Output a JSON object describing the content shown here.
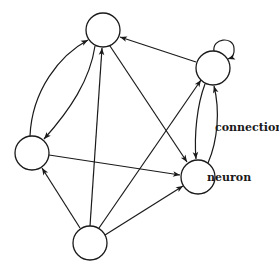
{
  "diagram": {
    "title": "",
    "labels": {
      "connection": "connection",
      "neuron": "neuron"
    },
    "colors": {
      "stroke": "#1a1a1a",
      "node_fill": "#ffffff",
      "background": "#ffffff"
    },
    "nodes": [
      {
        "id": "top",
        "cx": 103,
        "cy": 30,
        "r": 17
      },
      {
        "id": "right",
        "cx": 213,
        "cy": 68,
        "r": 17
      },
      {
        "id": "left",
        "cx": 32,
        "cy": 153,
        "r": 17
      },
      {
        "id": "neuron",
        "cx": 198,
        "cy": 177,
        "r": 17
      },
      {
        "id": "bottom",
        "cx": 90,
        "cy": 243,
        "r": 17
      }
    ],
    "edges": [
      {
        "from": "left",
        "to": "top",
        "shape": "curve"
      },
      {
        "from": "top",
        "to": "left",
        "shape": "curve"
      },
      {
        "from": "bottom",
        "to": "top",
        "shape": "straight"
      },
      {
        "from": "top",
        "to": "neuron",
        "shape": "straight"
      },
      {
        "from": "right",
        "to": "top",
        "shape": "straight"
      },
      {
        "from": "right",
        "to": "right",
        "shape": "self-loop"
      },
      {
        "from": "right",
        "to": "neuron",
        "shape": "curve"
      },
      {
        "from": "neuron",
        "to": "right",
        "shape": "curve"
      },
      {
        "from": "left",
        "to": "neuron",
        "shape": "straight"
      },
      {
        "from": "bottom",
        "to": "left",
        "shape": "straight"
      },
      {
        "from": "bottom",
        "to": "right",
        "shape": "straight"
      },
      {
        "from": "bottom",
        "to": "neuron",
        "shape": "straight"
      }
    ]
  }
}
